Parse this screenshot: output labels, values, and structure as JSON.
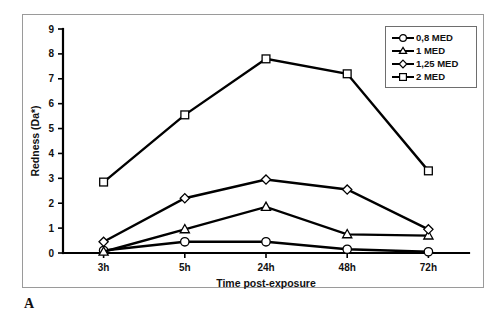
{
  "panel": {
    "letter": "A"
  },
  "chart_data": {
    "type": "line",
    "title": "",
    "xlabel": "Time post-exposure",
    "ylabel": "Redness (Da*)",
    "categories": [
      "3h",
      "5h",
      "24h",
      "48h",
      "72h"
    ],
    "xticklabels": [
      "3h",
      "5h",
      "24h",
      "48h",
      "72h"
    ],
    "yticklabels": [
      "0",
      "1",
      "2",
      "3",
      "4",
      "5",
      "6",
      "7",
      "8",
      "9"
    ],
    "yticks": [
      0,
      1,
      2,
      3,
      4,
      5,
      6,
      7,
      8,
      9
    ],
    "ylim": [
      0,
      9
    ],
    "grid": false,
    "legend_position": "top-right",
    "series": [
      {
        "name": "0,8 MED",
        "marker": "circle",
        "values": [
          0.1,
          0.45,
          0.45,
          0.15,
          0.05
        ]
      },
      {
        "name": "1 MED",
        "marker": "triangle",
        "values": [
          0.05,
          0.95,
          1.85,
          0.75,
          0.7
        ]
      },
      {
        "name": "1,25 MED",
        "marker": "diamond",
        "values": [
          0.45,
          2.2,
          2.95,
          2.55,
          0.95
        ]
      },
      {
        "name": "2 MED",
        "marker": "square",
        "values": [
          2.85,
          5.55,
          7.8,
          7.2,
          3.3
        ]
      }
    ]
  },
  "colors": {
    "line": "#000000",
    "marker_fill": "#ffffff",
    "frame": "#9a9a9a",
    "legend_border": "#6e6e6e",
    "background": "#ffffff"
  }
}
